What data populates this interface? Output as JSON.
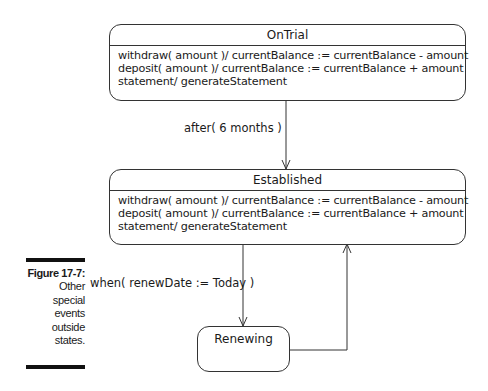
{
  "figure": {
    "number": "Figure 17-7:",
    "caption_lines": [
      "Other",
      "special",
      "events",
      "outside",
      "states."
    ]
  },
  "states": {
    "ontrial": {
      "name": "OnTrial",
      "actions": [
        "withdraw( amount )/ currentBalance := currentBalance - amount",
        "deposit( amount )/ currentBalance := currentBalance + amount",
        "statement/ generateStatement"
      ]
    },
    "established": {
      "name": "Established",
      "actions": [
        "withdraw( amount )/ currentBalance := currentBalance - amount",
        "deposit( amount )/ currentBalance := currentBalance + amount",
        "statement/ generateStatement"
      ]
    },
    "renewing": {
      "name": "Renewing"
    }
  },
  "transitions": {
    "ontrial_to_established": "after( 6 months )",
    "established_to_renewing": "when( renewDate := Today )"
  }
}
